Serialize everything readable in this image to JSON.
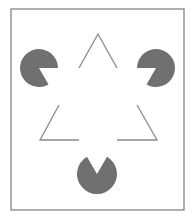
{
  "figure": {
    "name": "Kanizsa triangle illusion",
    "colors": {
      "background": "#ffffff",
      "frame": "#7a7a7a",
      "pacman_fill": "#707070",
      "outline": "#8a8a8a"
    },
    "frame": {
      "x": 11,
      "y": 9,
      "width": 173,
      "height": 201
    },
    "pacmen": [
      {
        "id": "left",
        "cx": 39,
        "cy": 68,
        "r": 19,
        "mouth_start_deg": 0,
        "mouth_end_deg": 60
      },
      {
        "id": "right",
        "cx": 156,
        "cy": 68,
        "r": 19,
        "mouth_start_deg": 120,
        "mouth_end_deg": 180
      },
      {
        "id": "bottom",
        "cx": 97,
        "cy": 174,
        "r": 20,
        "mouth_start_deg": 240,
        "mouth_end_deg": 300
      }
    ],
    "outline_segments": [
      {
        "id": "top-left",
        "points": [
          [
            79,
            68
          ],
          [
            98,
            34
          ],
          [
            117,
            68
          ]
        ]
      },
      {
        "id": "bottom-left",
        "points": [
          [
            59,
            105
          ],
          [
            40,
            140
          ],
          [
            79,
            140
          ]
        ]
      },
      {
        "id": "bottom-right",
        "points": [
          [
            137,
            105
          ],
          [
            157,
            140
          ],
          [
            117,
            140
          ]
        ]
      }
    ]
  }
}
